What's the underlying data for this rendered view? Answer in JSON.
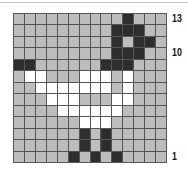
{
  "grid": {
    "columns": 14,
    "rows": 13,
    "legend": {
      "g": "gray",
      "d": "dark",
      "w": "white"
    },
    "colors": {
      "gray": "#bdbdbd",
      "dark": "#2e2e2e",
      "white": "#ffffff",
      "line": "#555555"
    },
    "cells": [
      "ggggggggggdggg",
      "gggggggggdddgg",
      "gggggggggdgddg",
      "gggggggggdddgg",
      "ddggggggdddggg",
      "gwwgggwwwgwggg",
      "ggwwwwwwwgwggg",
      "gggwwwgggwwggg",
      "ggggwwwwwwgggg",
      "ggggggwwwggggg",
      "ggggggdgdggggg",
      "ggggggdgdggggg",
      "gggggdgdgdgggg"
    ]
  },
  "row_labels": [
    {
      "text": "13",
      "row_from_top": 1
    },
    {
      "text": "10",
      "row_from_top": 4
    },
    {
      "text": "1",
      "row_from_top": 13
    }
  ]
}
